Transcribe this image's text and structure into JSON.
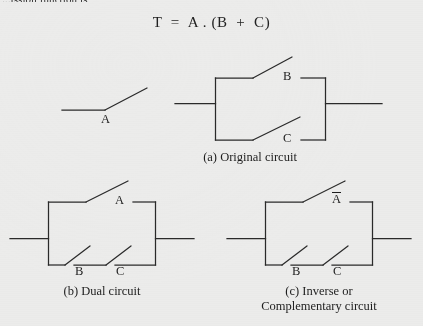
{
  "page": {
    "background_color": "#ececeb",
    "ink_color": "#2a2a2a",
    "lead_text": "...ission function is",
    "formula": "T  =  A . (B  +  C)"
  },
  "figures": [
    {
      "id": "original-circuit",
      "caption": "(a) Original circuit",
      "caption_line2": "",
      "series_switch": {
        "label": "A",
        "complemented": false
      },
      "parallel_switches": [
        {
          "label": "B",
          "complemented": false
        },
        {
          "label": "C",
          "complemented": false
        }
      ]
    },
    {
      "id": "dual-circuit",
      "caption": "(b) Dual circuit",
      "caption_line2": "",
      "parallel_top_switch": {
        "label": "A",
        "complemented": false
      },
      "series_bottom_switches": [
        {
          "label": "B",
          "complemented": false
        },
        {
          "label": "C",
          "complemented": false
        }
      ]
    },
    {
      "id": "inverse-circuit",
      "caption": "(c) Inverse or",
      "caption_line2": "Complementary circuit",
      "parallel_top_switch": {
        "label": "A",
        "complemented": true
      },
      "series_bottom_switches": [
        {
          "label": "B",
          "complemented": false
        },
        {
          "label": "C",
          "complemented": false
        }
      ]
    }
  ],
  "labels": {
    "a_switch_standalone": "A",
    "a_top_b": "B",
    "a_bot_c": "C",
    "b_top_a": "A",
    "b_bot_b": "B",
    "b_bot_c": "C",
    "c_top_a": "A",
    "c_bot_b": "B",
    "c_bot_c": "C"
  }
}
